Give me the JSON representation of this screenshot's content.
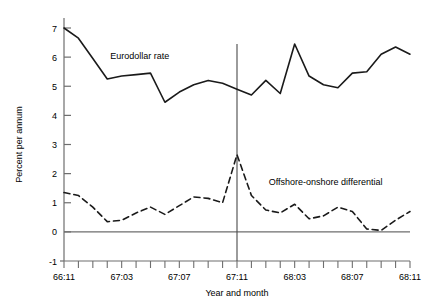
{
  "chart_data": {
    "type": "line",
    "title": "",
    "xlabel": "Year and month",
    "ylabel": "Percent per annum",
    "ylim": [
      -1,
      7
    ],
    "xlim": [
      0,
      24
    ],
    "grid": false,
    "legend_position": "inline-annotation",
    "yticks": [
      -1,
      0,
      1,
      2,
      3,
      4,
      5,
      6,
      7
    ],
    "ytick_labels": [
      "-1",
      "0",
      "1",
      "2",
      "3",
      "4",
      "5",
      "6",
      "7"
    ],
    "xtick_labels": [
      "66:11",
      "67:03",
      "67:07",
      "67:11",
      "68:03",
      "68:07",
      "68:11"
    ],
    "xtick_label_indices": [
      0,
      4,
      8,
      12,
      16,
      20,
      24
    ],
    "x": [
      0,
      1,
      2,
      3,
      4,
      5,
      6,
      7,
      8,
      9,
      10,
      11,
      12,
      13,
      14,
      15,
      16,
      17,
      18,
      19,
      20,
      21,
      22,
      23,
      24
    ],
    "x_categories": [
      "66:11",
      "66:12",
      "67:01",
      "67:02",
      "67:03",
      "67:04",
      "67:05",
      "67:06",
      "67:07",
      "67:08",
      "67:09",
      "67:10",
      "67:11",
      "67:12",
      "68:01",
      "68:02",
      "68:03",
      "68:04",
      "68:05",
      "68:06",
      "68:07",
      "68:08",
      "68:09",
      "68:10",
      "68:11"
    ],
    "series": [
      {
        "name": "Eurodollar rate",
        "style": "solid",
        "color": "#1a1a1a",
        "label_x_index": 3.2,
        "label_y_value": 5.95,
        "values": [
          7.0,
          6.65,
          5.95,
          5.25,
          5.35,
          5.4,
          5.45,
          4.45,
          4.8,
          5.05,
          5.2,
          5.1,
          4.9,
          4.7,
          5.2,
          4.75,
          6.45,
          5.35,
          5.05,
          4.95,
          5.45,
          5.5,
          6.1,
          6.35,
          6.1
        ]
      },
      {
        "name": "Offshore-onshore differential",
        "style": "dashed",
        "color": "#1a1a1a",
        "label_x_index": 14.2,
        "label_y_value": 1.6,
        "values": [
          1.35,
          1.25,
          0.85,
          0.35,
          0.4,
          0.65,
          0.85,
          0.6,
          0.9,
          1.2,
          1.15,
          1.0,
          2.65,
          1.25,
          0.75,
          0.65,
          0.95,
          0.45,
          0.55,
          0.85,
          0.7,
          0.1,
          0.05,
          0.4,
          0.7
        ]
      }
    ],
    "reference_line": {
      "name": "67:11 marker",
      "x_index": 12,
      "from_value": 2.65,
      "to_value": 6.45
    },
    "zero_line": {
      "name": "zero-baseline",
      "value": 0
    }
  }
}
